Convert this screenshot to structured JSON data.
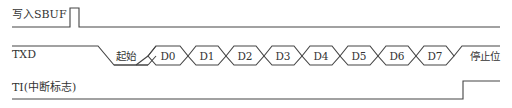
{
  "diagram": {
    "title": "",
    "line_color": "#444444",
    "signals": [
      {
        "name": "写入SBUF",
        "type": "pulse",
        "description": "single short high pulse then low"
      },
      {
        "name": "TXD",
        "type": "serial-frame",
        "segments": [
          "起始",
          "D0",
          "D1",
          "D2",
          "D3",
          "D4",
          "D5",
          "D6",
          "D7",
          "停止位"
        ]
      },
      {
        "name": "TI(中断标志)",
        "type": "step",
        "description": "low, rises high after stop bit"
      }
    ]
  }
}
